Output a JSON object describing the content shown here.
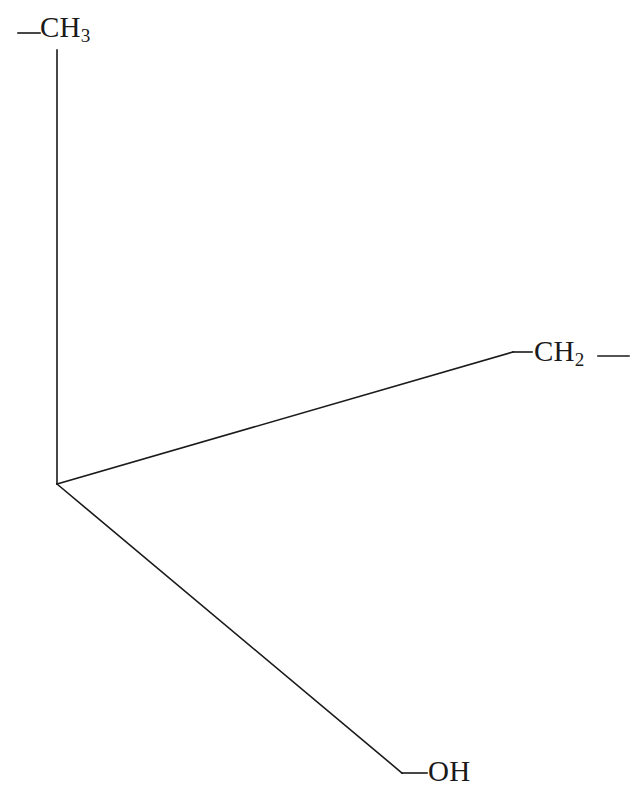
{
  "diagram": {
    "type": "chemical-structure",
    "background_color": "#ffffff",
    "bond_color": "#1a1a1a",
    "bond_width": 1.6,
    "labels": {
      "ch3": {
        "element": "CH",
        "subscript": "3",
        "full_text": "CH3"
      },
      "ch2": {
        "element": "CH",
        "subscript": "2",
        "full_text": "CH2"
      },
      "oh": {
        "element": "OH",
        "subscript": "",
        "full_text": "OH"
      }
    },
    "vertex": {
      "x": 57,
      "y": 484
    },
    "bonds": [
      {
        "name": "ch3-stub",
        "x1": 18,
        "y1": 33,
        "x2": 40,
        "y2": 33
      },
      {
        "name": "ch3-vertical",
        "x1": 57,
        "y1": 50,
        "x2": 57,
        "y2": 484
      },
      {
        "name": "center-to-ch2",
        "x1": 57,
        "y1": 484,
        "x2": 513,
        "y2": 352
      },
      {
        "name": "ch2-left-stub",
        "x1": 513,
        "y1": 352,
        "x2": 532,
        "y2": 352
      },
      {
        "name": "ch2-right-stub",
        "x1": 598,
        "y1": 356,
        "x2": 629,
        "y2": 356
      },
      {
        "name": "center-to-oh",
        "x1": 57,
        "y1": 484,
        "x2": 402,
        "y2": 773
      },
      {
        "name": "oh-stub",
        "x1": 402,
        "y1": 773,
        "x2": 427,
        "y2": 773
      }
    ]
  }
}
